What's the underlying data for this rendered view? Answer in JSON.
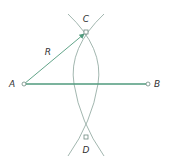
{
  "diagram": {
    "title": "",
    "colors": {
      "segment": "#4f9a7c",
      "arc": "#8aa39a",
      "point": "#6f8a80",
      "text": "#333333"
    },
    "points": [
      {
        "id": "A",
        "label": "A",
        "x": 24,
        "y": 84,
        "lx": 12,
        "ly": 84
      },
      {
        "id": "B",
        "label": "B",
        "x": 148,
        "y": 84,
        "lx": 157,
        "ly": 84
      },
      {
        "id": "C",
        "label": "C",
        "x": 86,
        "y": 32,
        "lx": 86,
        "ly": 19
      },
      {
        "id": "D",
        "label": "D",
        "x": 86,
        "y": 137,
        "lx": 86,
        "ly": 150
      }
    ],
    "radius_label": {
      "text": "R",
      "x": 48,
      "y": 52
    },
    "segment_AB": {
      "from": "A",
      "to": "B"
    },
    "radius_arrow": {
      "from": "A",
      "to": "C"
    }
  }
}
